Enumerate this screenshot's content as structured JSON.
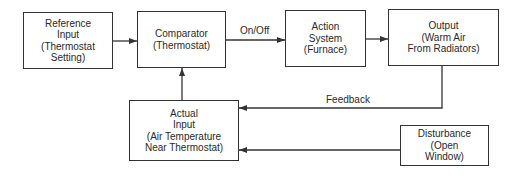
{
  "diagram": {
    "blocks": [
      {
        "id": "reference",
        "text": "Reference\nInput\n(Thermostat\nSetting)"
      },
      {
        "id": "comparator",
        "text": "Comparator\n(Thermostat)"
      },
      {
        "id": "action",
        "text": "Action\nSystem\n(Furnace)"
      },
      {
        "id": "output",
        "text": "Output\n(Warm Air\nFrom Radiators)"
      },
      {
        "id": "actual",
        "text": "Actual\nInput\n(Air Temperature\nNear Thermostat)"
      },
      {
        "id": "disturbance",
        "text": "Disturbance\n(Open\nWindow)"
      }
    ],
    "edge_labels": {
      "comparator_to_action": "On/Off",
      "feedback": "Feedback"
    },
    "edges": [
      {
        "from": "reference",
        "to": "comparator"
      },
      {
        "from": "comparator",
        "to": "action",
        "label": "On/Off"
      },
      {
        "from": "action",
        "to": "output"
      },
      {
        "from": "output",
        "to": "actual",
        "label": "Feedback"
      },
      {
        "from": "disturbance",
        "to": "actual"
      },
      {
        "from": "actual",
        "to": "comparator"
      }
    ],
    "colors": {
      "line": "#333333",
      "text": "#2a2a2a",
      "background": "#ffffff"
    }
  }
}
